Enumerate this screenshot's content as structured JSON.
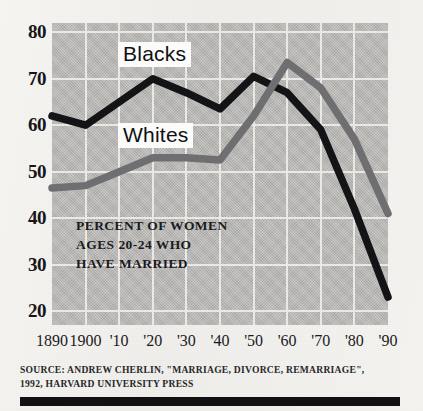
{
  "chart_data": {
    "type": "line",
    "title": "",
    "caption": "PERCENT OF WOMEN\nAGES 20-24 WHO\nHAVE MARRIED",
    "xlabel": "",
    "ylabel": "",
    "ylim": [
      17,
      82
    ],
    "xlim": [
      1890,
      1990
    ],
    "grid": true,
    "legend_position": "inline-annotation",
    "x": [
      1890,
      1900,
      1910,
      1920,
      1930,
      1940,
      1950,
      1960,
      1970,
      1980,
      1990
    ],
    "xtick_labels": [
      "1890",
      "1900",
      "'10",
      "'20",
      "'30",
      "'40",
      "'50",
      "'60",
      "'70",
      "'80",
      "'90"
    ],
    "ytick_labels": [
      "80",
      "70",
      "60",
      "50",
      "40",
      "30",
      "20"
    ],
    "ytick_values": [
      80,
      70,
      60,
      50,
      40,
      30,
      20
    ],
    "series": [
      {
        "name": "Blacks",
        "color": "#141417",
        "values": [
          62,
          60,
          65,
          70,
          67,
          63.5,
          70.5,
          67,
          59,
          42,
          23
        ]
      },
      {
        "name": "Whites",
        "color": "#6f6f71",
        "values": [
          46.5,
          47,
          50,
          53,
          53,
          52.5,
          62,
          73.5,
          68,
          57,
          41
        ]
      }
    ],
    "annotations": [
      {
        "text": "Blacks",
        "x": 1918,
        "y": 75
      },
      {
        "text": "Whites",
        "x": 1918,
        "y": 57.5
      }
    ]
  },
  "footer": {
    "source_line_1": "SOURCE: ANDREW CHERLIN, \"MARRIAGE, DIVORCE, REMARRIAGE\",",
    "source_line_2": "1992, HARVARD UNIVERSITY PRESS"
  }
}
